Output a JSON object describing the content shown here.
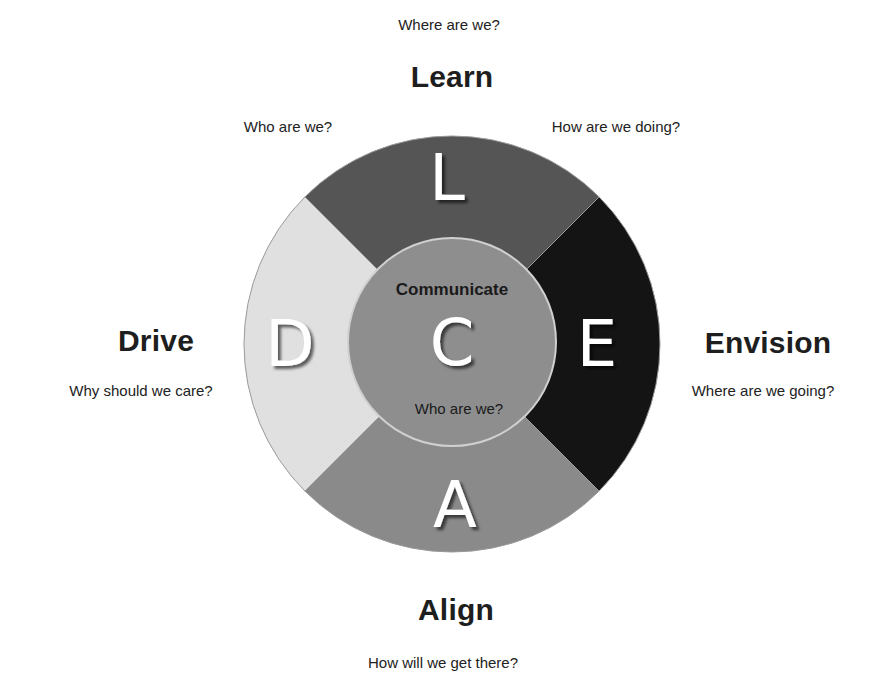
{
  "top": {
    "question": "Where are we?",
    "heading": "Learn",
    "left_question": "Who are we?",
    "right_question": "How are we doing?"
  },
  "left": {
    "heading": "Drive",
    "question": "Why should we care?"
  },
  "right": {
    "heading": "Envision",
    "question": "Where are we going?"
  },
  "bottom": {
    "heading": "Align",
    "question": "How will we get there?"
  },
  "wheel": {
    "segments": [
      {
        "key": "learn",
        "letter": "L",
        "position": "top",
        "color": "#555555"
      },
      {
        "key": "envision",
        "letter": "E",
        "position": "right",
        "color": "#141414"
      },
      {
        "key": "align",
        "letter": "A",
        "position": "bottom",
        "color": "#8a8a8a"
      },
      {
        "key": "drive",
        "letter": "D",
        "position": "left",
        "color": "#e0e0e0"
      }
    ],
    "center": {
      "letter": "C",
      "title": "Communicate",
      "question": "Who are we?",
      "color": "#8e8e8e",
      "stroke": "#d0d0d0"
    }
  }
}
